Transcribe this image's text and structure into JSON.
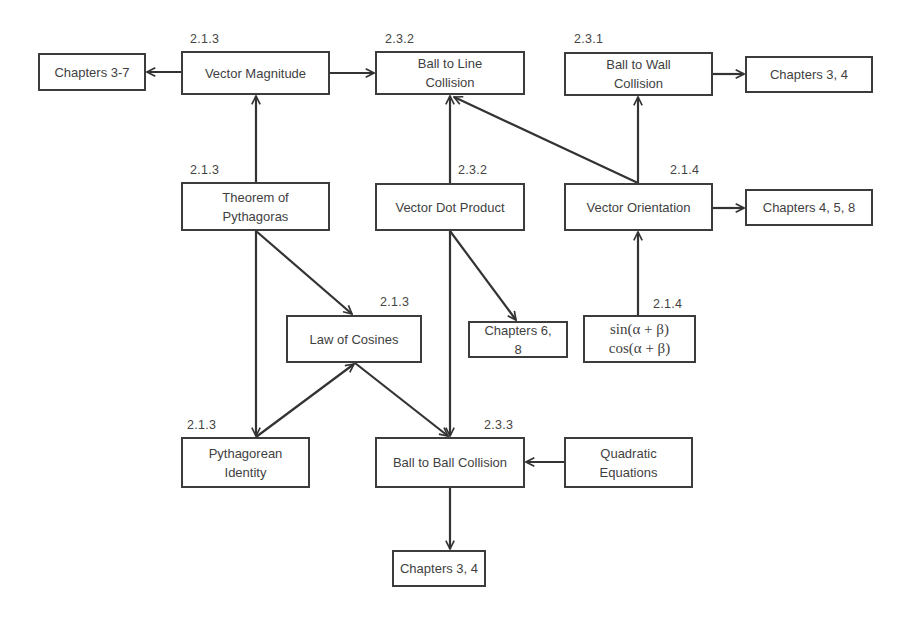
{
  "diagram": {
    "nodes": [
      {
        "id": "chapters-3-7",
        "label": "Chapters 3-7",
        "section": "",
        "box": [
          38,
          53,
          108,
          38
        ]
      },
      {
        "id": "vector-magnitude",
        "label": "Vector Magnitude",
        "section": "2.1.3",
        "box": [
          181,
          51,
          149,
          44
        ]
      },
      {
        "id": "ball-to-line-collision",
        "label": "Ball to Line\nCollision",
        "section": "2.3.2",
        "box": [
          375,
          51,
          150,
          44
        ]
      },
      {
        "id": "ball-to-wall-collision",
        "label": "Ball to Wall\nCollision",
        "section": "2.3.1",
        "box": [
          564,
          52,
          149,
          44
        ]
      },
      {
        "id": "chapters-3-4-top",
        "label": "Chapters 3, 4",
        "section": "",
        "box": [
          745,
          56,
          128,
          37
        ]
      },
      {
        "id": "theorem-of-pythagoras",
        "label": "Theorem of\nPythagoras",
        "section": "2.1.3",
        "box": [
          181,
          182,
          149,
          49
        ]
      },
      {
        "id": "vector-dot-product",
        "label": "Vector Dot Product",
        "section": "2.3.2",
        "box": [
          375,
          183,
          150,
          48
        ]
      },
      {
        "id": "vector-orientation",
        "label": "Vector Orientation",
        "section": "2.1.4",
        "box": [
          564,
          183,
          149,
          48
        ]
      },
      {
        "id": "chapters-4-5-8",
        "label": "Chapters 4, 5, 8",
        "section": "",
        "box": [
          745,
          189,
          128,
          37
        ]
      },
      {
        "id": "law-of-cosines",
        "label": "Law of Cosines",
        "section": "2.1.3",
        "box": [
          286,
          315,
          136,
          48
        ]
      },
      {
        "id": "chapters-6-8",
        "label": "Chapters 6,\n8",
        "section": "",
        "box": [
          468,
          321,
          100,
          37
        ]
      },
      {
        "id": "sum-angle-identities",
        "label": "sin(α + β)\ncos(α + β)",
        "section": "2.1.4",
        "box": [
          583,
          315,
          113,
          48
        ],
        "math": true
      },
      {
        "id": "pythagorean-identity",
        "label": "Pythagorean\nIdentity",
        "section": "2.1.3",
        "box": [
          181,
          437,
          129,
          51
        ]
      },
      {
        "id": "ball-to-ball-collision",
        "label": "Ball to Ball Collision",
        "section": "2.3.3",
        "box": [
          375,
          437,
          150,
          51
        ]
      },
      {
        "id": "quadratic-equations",
        "label": "Quadratic\nEquations",
        "section": "",
        "box": [
          564,
          437,
          129,
          51
        ]
      },
      {
        "id": "chapters-3-4-bottom",
        "label": "Chapters 3, 4",
        "section": "",
        "box": [
          392,
          550,
          94,
          37
        ]
      }
    ],
    "section_labels": [
      {
        "node": "vector-magnitude",
        "text": "2.1.3",
        "x": 190,
        "y": 32
      },
      {
        "node": "ball-to-line-collision",
        "text": "2.3.2",
        "x": 385,
        "y": 32
      },
      {
        "node": "ball-to-wall-collision",
        "text": "2.3.1",
        "x": 574,
        "y": 32
      },
      {
        "node": "theorem-of-pythagoras",
        "text": "2.1.3",
        "x": 190,
        "y": 163
      },
      {
        "node": "vector-dot-product",
        "text": "2.3.2",
        "x": 458,
        "y": 163
      },
      {
        "node": "vector-orientation",
        "text": "2.1.4",
        "x": 670,
        "y": 163
      },
      {
        "node": "law-of-cosines",
        "text": "2.1.3",
        "x": 380,
        "y": 295
      },
      {
        "node": "sum-angle-identities",
        "text": "2.1.4",
        "x": 653,
        "y": 297
      },
      {
        "node": "pythagorean-identity",
        "text": "2.1.3",
        "x": 187,
        "y": 418
      },
      {
        "node": "ball-to-ball-collision",
        "text": "2.3.3",
        "x": 484,
        "y": 418
      }
    ],
    "edges": [
      {
        "from": "vector-magnitude",
        "to": "chapters-3-7",
        "points": [
          181,
          72,
          147,
          72
        ]
      },
      {
        "from": "vector-magnitude",
        "to": "ball-to-line-collision",
        "points": [
          330,
          73,
          374,
          73
        ]
      },
      {
        "from": "ball-to-wall-collision",
        "to": "chapters-3-4-top",
        "points": [
          713,
          74,
          744,
          74
        ]
      },
      {
        "from": "theorem-of-pythagoras",
        "to": "vector-magnitude",
        "points": [
          256,
          182,
          256,
          96
        ]
      },
      {
        "from": "vector-dot-product",
        "to": "ball-to-line-collision",
        "points": [
          450,
          183,
          450,
          96
        ]
      },
      {
        "from": "vector-orientation",
        "to": "ball-to-line-collision",
        "points": [
          638,
          183,
          454,
          97
        ]
      },
      {
        "from": "vector-orientation",
        "to": "ball-to-wall-collision",
        "points": [
          638,
          183,
          638,
          97
        ]
      },
      {
        "from": "vector-orientation",
        "to": "chapters-4-5-8",
        "points": [
          713,
          208,
          744,
          208
        ]
      },
      {
        "from": "sum-angle-identities",
        "to": "vector-orientation",
        "points": [
          638,
          315,
          638,
          232
        ]
      },
      {
        "from": "theorem-of-pythagoras",
        "to": "law-of-cosines",
        "points": [
          256,
          231,
          352,
          314
        ]
      },
      {
        "from": "theorem-of-pythagoras",
        "to": "pythagorean-identity",
        "points": [
          256,
          231,
          256,
          436
        ]
      },
      {
        "from": "pythagorean-identity",
        "to": "law-of-cosines",
        "points": [
          256,
          437,
          354,
          364
        ]
      },
      {
        "from": "vector-dot-product",
        "to": "chapters-6-8",
        "points": [
          450,
          231,
          516,
          320
        ]
      },
      {
        "from": "vector-dot-product",
        "to": "ball-to-ball-collision",
        "points": [
          450,
          231,
          450,
          436
        ]
      },
      {
        "from": "law-of-cosines",
        "to": "ball-to-ball-collision",
        "points": [
          355,
          363,
          448,
          436
        ]
      },
      {
        "from": "quadratic-equations",
        "to": "ball-to-ball-collision",
        "points": [
          564,
          462,
          526,
          462
        ]
      },
      {
        "from": "ball-to-ball-collision",
        "to": "chapters-3-4-bottom",
        "points": [
          450,
          488,
          450,
          549
        ]
      }
    ],
    "colors": {
      "stroke": "#333333",
      "text": "#3f3f3f",
      "background": "#ffffff"
    }
  }
}
